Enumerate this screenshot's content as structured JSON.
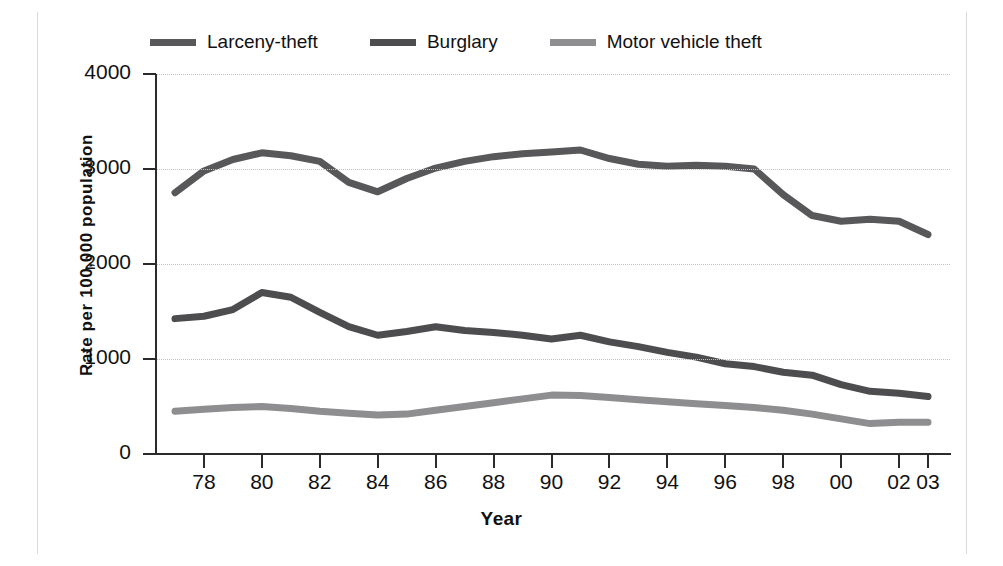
{
  "chart_data": {
    "type": "line",
    "title": "",
    "xlabel": "Year",
    "ylabel": "Rate per 100,000 population",
    "xlim": [
      1977,
      2003
    ],
    "ylim": [
      0,
      4000
    ],
    "grid": true,
    "legend_position": "top",
    "x": [
      1977,
      1978,
      1979,
      1980,
      1981,
      1982,
      1983,
      1984,
      1985,
      1986,
      1987,
      1988,
      1989,
      1990,
      1991,
      1992,
      1993,
      1994,
      1995,
      1996,
      1997,
      1998,
      1999,
      2000,
      2001,
      2002,
      2003
    ],
    "x_tick_labels": [
      "78",
      "80",
      "82",
      "84",
      "86",
      "88",
      "90",
      "92",
      "94",
      "96",
      "98",
      "00",
      "02",
      "03"
    ],
    "x_tick_values": [
      1978,
      1980,
      1982,
      1984,
      1986,
      1988,
      1990,
      1992,
      1994,
      1996,
      1998,
      2000,
      2002,
      2003
    ],
    "y_tick_labels": [
      "0",
      "1000",
      "2000",
      "3000",
      "4000"
    ],
    "y_tick_values": [
      0,
      1000,
      2000,
      3000,
      4000
    ],
    "series": [
      {
        "name": "Larceny-theft",
        "color": "#58585a",
        "values": [
          2750,
          2980,
          3100,
          3170,
          3140,
          3080,
          2860,
          2760,
          2900,
          3010,
          3080,
          3130,
          3160,
          3180,
          3200,
          3110,
          3050,
          3030,
          3040,
          3030,
          3000,
          2730,
          2510,
          2450,
          2470,
          2450,
          2310
        ]
      },
      {
        "name": "Burglary",
        "color": "#4d4d4f",
        "values": [
          1425,
          1450,
          1520,
          1700,
          1650,
          1490,
          1340,
          1250,
          1290,
          1340,
          1300,
          1280,
          1250,
          1210,
          1250,
          1180,
          1130,
          1070,
          1020,
          950,
          920,
          860,
          830,
          730,
          660,
          640,
          605
        ]
      },
      {
        "name": "Motor vehicle theft",
        "color": "#8e8e90",
        "values": [
          450,
          470,
          490,
          500,
          480,
          450,
          430,
          410,
          420,
          460,
          500,
          540,
          580,
          620,
          615,
          595,
          570,
          550,
          530,
          510,
          490,
          460,
          420,
          370,
          320,
          335,
          335
        ]
      }
    ]
  },
  "legend": {
    "items": [
      {
        "label": "Larceny-theft",
        "color": "#58585a"
      },
      {
        "label": "Burglary",
        "color": "#4d4d4f"
      },
      {
        "label": "Motor vehicle theft",
        "color": "#8e8e90"
      }
    ]
  },
  "axes": {
    "x_title": "Year",
    "y_title": "Rate per 100,000 population"
  }
}
